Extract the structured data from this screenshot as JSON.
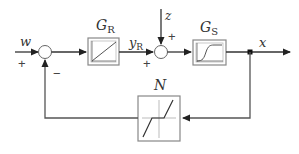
{
  "diagram": {
    "type": "block-diagram",
    "signals": {
      "reference": "w",
      "controller_output_main": "y",
      "controller_output_sub": "R",
      "disturbance": "z",
      "output": "x"
    },
    "blocks": {
      "controller": {
        "label_main": "G",
        "label_sub": "R",
        "icon": "linear-ramp-icon"
      },
      "plant": {
        "label_main": "G",
        "label_sub": "S",
        "icon": "s-curve-step-response-icon"
      },
      "feedback": {
        "label": "N",
        "icon": "dead-zone-nonlinearity-icon"
      }
    },
    "junctions": {
      "sum1": {
        "sign_reference": "+",
        "sign_feedback": "−"
      },
      "sum2": {
        "sign_controller": "+",
        "sign_disturbance": "+"
      }
    },
    "colors": {
      "line": "#333333",
      "block_border": "#777777",
      "block_inner_border": "#aaaaaa"
    }
  }
}
